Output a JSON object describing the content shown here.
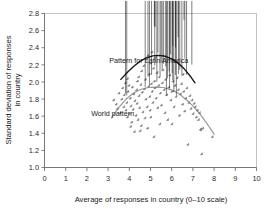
{
  "chart_data": {
    "type": "scatter",
    "title": "",
    "xlabel": "Average of responses in country (0–10 scale)",
    "ylabel_line1": "Standard deviation of responses",
    "ylabel_line2": "in country",
    "xlim": [
      0,
      10
    ],
    "ylim": [
      1.0,
      2.8
    ],
    "xticks": [
      "0",
      "1",
      "2",
      "3",
      "4",
      "5",
      "6",
      "7",
      "8",
      "9",
      "10"
    ],
    "yticks": [
      "1.0",
      "1.2",
      "1.4",
      "1.6",
      "1.8",
      "2.0",
      "2.2",
      "2.4",
      "2.6",
      "2.8"
    ],
    "grid": false,
    "legend_position": "none",
    "annotations": [
      {
        "name": "latin-america-curve-label",
        "text": "Pattern for Latin America",
        "x": 3.05,
        "y": 2.22
      },
      {
        "name": "world-curve-label",
        "text": "World pattern",
        "x": 2.2,
        "y": 1.6
      }
    ],
    "series": [
      {
        "name": "World countries",
        "marker": "diamond",
        "color": "#8c8c8c",
        "edge_color": "#6b6b6b",
        "points": [
          [
            3.3,
            1.78
          ],
          [
            3.42,
            1.73
          ],
          [
            3.48,
            1.68
          ],
          [
            3.55,
            1.86
          ],
          [
            3.62,
            1.63
          ],
          [
            3.68,
            1.79
          ],
          [
            3.72,
            1.92
          ],
          [
            3.78,
            1.7
          ],
          [
            3.8,
            1.84
          ],
          [
            3.85,
            1.98
          ],
          [
            3.88,
            1.66
          ],
          [
            3.92,
            1.75
          ],
          [
            3.95,
            1.58
          ],
          [
            3.98,
            1.88
          ],
          [
            4.02,
            1.95
          ],
          [
            4.05,
            1.62
          ],
          [
            4.08,
            1.8
          ],
          [
            4.12,
            1.71
          ],
          [
            4.15,
            1.52
          ],
          [
            4.18,
            1.93
          ],
          [
            4.22,
            1.67
          ],
          [
            4.25,
            1.85
          ],
          [
            4.28,
            1.41
          ],
          [
            4.3,
            1.77
          ],
          [
            4.35,
            1.6
          ],
          [
            4.38,
            1.9
          ],
          [
            4.4,
            1.74
          ],
          [
            4.45,
            1.55
          ],
          [
            4.48,
            2.05
          ],
          [
            4.5,
            1.83
          ],
          [
            4.52,
            1.69
          ],
          [
            4.58,
            1.96
          ],
          [
            4.6,
            1.48
          ],
          [
            4.62,
            2.12
          ],
          [
            4.65,
            1.87
          ],
          [
            4.68,
            1.64
          ],
          [
            4.72,
            2.18
          ],
          [
            4.75,
            1.91
          ],
          [
            4.78,
            1.57
          ],
          [
            4.8,
            2.02
          ],
          [
            4.82,
            1.79
          ],
          [
            4.85,
            2.26
          ],
          [
            4.88,
            1.7
          ],
          [
            4.9,
            1.45
          ],
          [
            4.92,
            2.3
          ],
          [
            4.95,
            1.94
          ],
          [
            4.98,
            2.08
          ],
          [
            5.0,
            1.82
          ],
          [
            5.02,
            1.66
          ],
          [
            5.05,
            2.21
          ],
          [
            5.08,
            1.97
          ],
          [
            5.1,
            2.34
          ],
          [
            5.12,
            1.88
          ],
          [
            5.15,
            1.75
          ],
          [
            5.18,
            2.15
          ],
          [
            5.2,
            1.35
          ],
          [
            5.22,
            2.0
          ],
          [
            5.25,
            1.92
          ],
          [
            5.28,
            2.28
          ],
          [
            5.3,
            1.8
          ],
          [
            5.35,
            2.1
          ],
          [
            5.38,
            1.69
          ],
          [
            5.42,
            1.95
          ],
          [
            5.45,
            2.05
          ],
          [
            5.5,
            1.86
          ],
          [
            5.55,
            1.72
          ],
          [
            5.6,
            1.98
          ],
          [
            5.62,
            2.13
          ],
          [
            5.68,
            1.9
          ],
          [
            5.72,
            1.63
          ],
          [
            5.75,
            2.02
          ],
          [
            5.8,
            1.84
          ],
          [
            5.85,
            1.55
          ],
          [
            5.9,
            1.93
          ],
          [
            5.95,
            2.07
          ],
          [
            6.0,
            1.78
          ],
          [
            6.05,
            1.88
          ],
          [
            6.1,
            2.0
          ],
          [
            6.15,
            1.7
          ],
          [
            6.2,
            1.95
          ],
          [
            6.25,
            1.82
          ],
          [
            6.3,
            2.04
          ],
          [
            6.35,
            1.9
          ],
          [
            6.4,
            1.6
          ],
          [
            6.45,
            1.85
          ],
          [
            6.5,
            1.97
          ],
          [
            6.55,
            1.73
          ],
          [
            6.58,
            2.08
          ],
          [
            6.6,
            1.88
          ],
          [
            6.65,
            1.65
          ],
          [
            6.7,
            1.8
          ],
          [
            6.75,
            1.92
          ],
          [
            6.8,
            1.26
          ],
          [
            6.85,
            1.75
          ],
          [
            6.9,
            1.83
          ],
          [
            6.95,
            1.68
          ],
          [
            7.0,
            1.78
          ],
          [
            7.05,
            1.62
          ],
          [
            7.1,
            1.74
          ],
          [
            7.15,
            1.7
          ],
          [
            7.2,
            1.58
          ],
          [
            7.25,
            1.66
          ],
          [
            7.3,
            1.55
          ],
          [
            7.35,
            1.63
          ],
          [
            7.4,
            1.44
          ],
          [
            7.42,
            1.43
          ],
          [
            7.45,
            1.15
          ],
          [
            7.5,
            1.45
          ],
          [
            7.95,
            1.35
          ],
          [
            4.1,
            1.47
          ],
          [
            4.55,
            1.42
          ],
          [
            5.48,
            1.5
          ],
          [
            5.05,
            1.58
          ],
          [
            6.05,
            1.5
          ],
          [
            3.95,
            2.03
          ],
          [
            4.42,
            2.0
          ]
        ]
      },
      {
        "name": "Latin American countries",
        "marker": "diamond",
        "color": "#1a1a1a",
        "edge_color": "#000000",
        "points": [
          [
            5.18,
            2.63
          ],
          [
            5.22,
            2.62
          ],
          [
            6.58,
            2.7
          ],
          [
            6.3,
            2.5
          ],
          [
            6.05,
            2.4
          ],
          [
            6.18,
            2.38
          ],
          [
            6.62,
            2.25
          ],
          [
            6.95,
            2.18
          ],
          [
            5.95,
            2.3
          ],
          [
            5.35,
            2.32
          ],
          [
            5.5,
            2.2
          ],
          [
            5.62,
            2.19
          ],
          [
            5.2,
            2.17
          ],
          [
            5.72,
            2.16
          ],
          [
            5.88,
            2.1
          ],
          [
            6.02,
            2.08
          ],
          [
            6.18,
            2.06
          ],
          [
            6.32,
            2.07
          ],
          [
            6.48,
            2.05
          ],
          [
            5.45,
            2.05
          ],
          [
            5.05,
            2.06
          ],
          [
            4.88,
            2.04
          ],
          [
            5.8,
            2.02
          ],
          [
            6.05,
            2.0
          ],
          [
            5.3,
            1.98
          ],
          [
            4.75,
            1.92
          ],
          [
            5.9,
            1.9
          ],
          [
            6.1,
            1.86
          ],
          [
            5.75,
            1.82
          ],
          [
            6.22,
            1.82
          ],
          [
            3.82,
            1.84
          ],
          [
            3.88,
            1.82
          ],
          [
            4.95,
            1.94
          ],
          [
            5.55,
            2.12
          ],
          [
            6.38,
            2.12
          ],
          [
            6.7,
            2.06
          ]
        ]
      }
    ],
    "fit_curves": [
      {
        "name": "latin-america-fit",
        "label": "Pattern for Latin America",
        "color": "#1a1a1a",
        "width": 1.4,
        "points": [
          [
            3.6,
            2.03
          ],
          [
            3.9,
            2.11
          ],
          [
            4.2,
            2.18
          ],
          [
            4.5,
            2.24
          ],
          [
            4.8,
            2.28
          ],
          [
            5.1,
            2.305
          ],
          [
            5.4,
            2.31
          ],
          [
            5.7,
            2.3
          ],
          [
            6.0,
            2.27
          ],
          [
            6.3,
            2.22
          ],
          [
            6.6,
            2.15
          ],
          [
            6.9,
            2.06
          ],
          [
            7.1,
            1.99
          ]
        ]
      },
      {
        "name": "world-fit",
        "label": "World pattern",
        "color": "#9a9a9a",
        "width": 1.2,
        "points": [
          [
            3.15,
            1.58
          ],
          [
            3.5,
            1.7
          ],
          [
            3.85,
            1.8
          ],
          [
            4.2,
            1.87
          ],
          [
            4.55,
            1.915
          ],
          [
            4.9,
            1.935
          ],
          [
            5.25,
            1.94
          ],
          [
            5.6,
            1.935
          ],
          [
            5.95,
            1.91
          ],
          [
            6.3,
            1.87
          ],
          [
            6.65,
            1.8
          ],
          [
            7.0,
            1.72
          ],
          [
            7.35,
            1.62
          ],
          [
            7.7,
            1.5
          ],
          [
            8.0,
            1.39
          ]
        ]
      }
    ]
  }
}
